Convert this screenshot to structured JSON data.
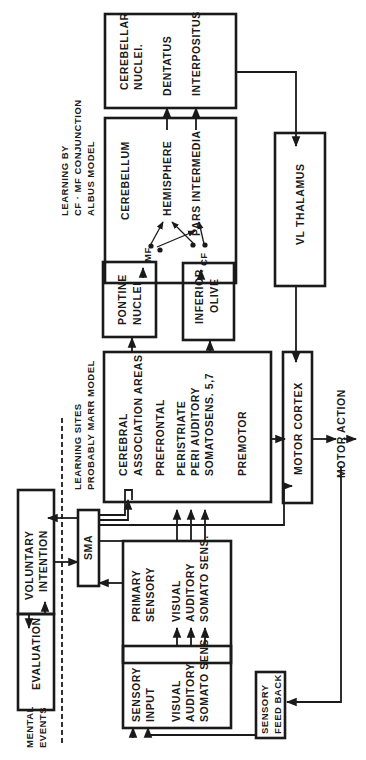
{
  "diagram": {
    "orientation": "rotated-90-ccw",
    "annotations": {
      "mental_events": [
        "MENTAL",
        "EVENTS"
      ],
      "learning_sites": [
        "LEARNING SITES",
        "PROBABLY MARR MODEL"
      ],
      "learning_by": [
        "LEARNING BY",
        "CF · MF CONJUNCTION",
        "ALBUS MODEL"
      ],
      "motor_action": "MOTOR ACTION"
    },
    "boxes": {
      "cerebellar_nuclei": {
        "title": [
          "CEREBELLAR",
          "NUCLEI."
        ],
        "items": [
          "DENTATUS",
          "INTERPOSITUS"
        ]
      },
      "cerebellum": {
        "title": "CEREBELLUM",
        "items": [
          "HEMISPHERE",
          "PARS INTERMEDIA"
        ]
      },
      "pontine_nuclei": {
        "title": [
          "PONTINE",
          "NUCLEI"
        ]
      },
      "inferior_olive": {
        "title": [
          "INFERIOR",
          "OLIVE"
        ]
      },
      "vl_thalamus": {
        "title": "VL THALAMUS"
      },
      "cerebral_association": {
        "title": [
          "CEREBRAL",
          "ASSOCIATION   AREAS"
        ],
        "items": [
          "PREFRONTAL",
          "PERISTRIATE",
          "PERI AUDITORY",
          "SOMATOSENS. 5,7",
          "PREMOTOR"
        ]
      },
      "motor_cortex": {
        "title": "MOTOR  CORTEX"
      },
      "voluntary_intention": {
        "title": [
          "VOLUNTARY",
          "INTENTION"
        ]
      },
      "evaluation": {
        "title": "EVALUATION"
      },
      "sma": {
        "title": "SMA"
      },
      "primary_sensory": {
        "title": [
          "PRIMARY",
          "SENSORY"
        ],
        "items": [
          "VISUAL",
          "AUDITORY",
          "SOMATO SENS."
        ]
      },
      "sensory_input": {
        "title": [
          "SENSORY",
          "INPUT"
        ],
        "items": [
          "VISUAL",
          "AUDITORY",
          "SOMATO SENS."
        ]
      },
      "sensory_feedback": {
        "title": [
          "SENSORY",
          "FEED BACK"
        ]
      }
    },
    "connection_labels": {
      "mf": "MF",
      "cf": "CF"
    },
    "colors": {
      "ink": "#1a1a1a",
      "paper": "#ffffff"
    }
  }
}
